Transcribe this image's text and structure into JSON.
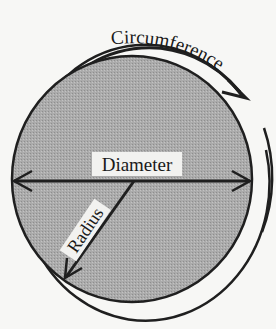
{
  "diagram": {
    "labels": {
      "circumference": "Circumference",
      "diameter": "Diameter",
      "radius": "Radius"
    },
    "colors": {
      "background": "#f7f7f5",
      "fill": "#a9a9a9",
      "stroke": "#1f1f1f",
      "label_bg": "#f2f2f0"
    }
  }
}
